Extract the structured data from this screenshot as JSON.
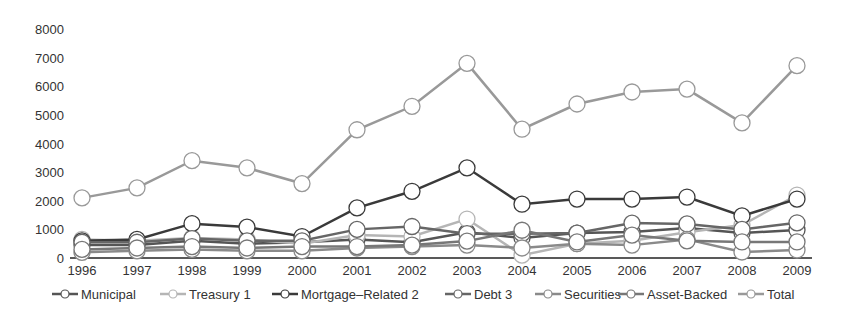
{
  "chart_data": {
    "type": "line",
    "title": "",
    "xlabel": "",
    "ylabel": "",
    "ylim": [
      0,
      8000
    ],
    "yticks": [
      0,
      1000,
      2000,
      3000,
      4000,
      5000,
      6000,
      7000,
      8000
    ],
    "grid": false,
    "legend_position": "bottom",
    "x": [
      "1996",
      "1997",
      "1998",
      "1999",
      "2000",
      "2001",
      "2002",
      "2003",
      "2004",
      "2005",
      "2006",
      "2007",
      "2008",
      "2009"
    ],
    "series": [
      {
        "name": "Municipal",
        "color": "#555555",
        "values": [
          450,
          450,
          600,
          500,
          550,
          650,
          550,
          900,
          700,
          870,
          910,
          1050,
          870,
          980
        ]
      },
      {
        "name": "Treasury 1",
        "color": "#b5b5b5",
        "values": [
          650,
          600,
          700,
          650,
          500,
          800,
          750,
          1360,
          100,
          500,
          600,
          900,
          1150,
          2200
        ]
      },
      {
        "name": "Mortgage–Related 2",
        "color": "#3a3a3a",
        "values": [
          600,
          650,
          1200,
          1080,
          750,
          1750,
          2330,
          3150,
          1880,
          2060,
          2060,
          2130,
          1470,
          2060
        ]
      },
      {
        "name": "Debt 3",
        "color": "#666666",
        "values": [
          550,
          550,
          680,
          600,
          600,
          1000,
          1100,
          850,
          850,
          870,
          1220,
          1190,
          1000,
          1230
        ]
      },
      {
        "name": "Securities",
        "color": "#8a8a8a",
        "values": [
          200,
          250,
          300,
          250,
          250,
          350,
          400,
          450,
          350,
          500,
          450,
          650,
          210,
          280
        ]
      },
      {
        "name": "Asset-Backed",
        "color": "#777777",
        "values": [
          300,
          350,
          400,
          350,
          400,
          400,
          450,
          590,
          970,
          560,
          800,
          600,
          560,
          560
        ]
      },
      {
        "name": "Total",
        "color": "#999999",
        "values": [
          2100,
          2450,
          3400,
          3150,
          2600,
          4480,
          5300,
          6800,
          4500,
          5380,
          5800,
          5900,
          4720,
          6720
        ]
      }
    ]
  },
  "legend": {
    "items": [
      "Municipal",
      "Treasury 1",
      "Mortgage–Related 2",
      "Debt 3",
      "Securities",
      "Asset-Backed",
      "Total"
    ]
  }
}
